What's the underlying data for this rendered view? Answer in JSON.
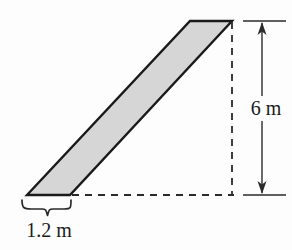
{
  "figure": {
    "background_color": "#fdfdfd",
    "shape": {
      "name": "parallelogram",
      "fill_color": "#d6d6d6",
      "stroke_color": "#1a1a1a",
      "stroke_width": 2.4,
      "vertices": [
        {
          "x": 27,
          "y": 195,
          "label": "bottom-left"
        },
        {
          "x": 70,
          "y": 195,
          "label": "bottom-right"
        },
        {
          "x": 232,
          "y": 21,
          "label": "top-right"
        },
        {
          "x": 190,
          "y": 21,
          "label": "top-left"
        }
      ]
    },
    "construction_lines": [
      {
        "name": "vertical-dashed-line",
        "style": "dashed",
        "color": "#1a1a1a",
        "x1": 232,
        "y1": 21,
        "x2": 232,
        "y2": 195
      },
      {
        "name": "horizontal-dashed-line",
        "style": "dashed",
        "color": "#1a1a1a",
        "x1": 72,
        "y1": 195,
        "x2": 234,
        "y2": 195
      }
    ],
    "dimensions": [
      {
        "name": "height-dimension",
        "value": "6 m",
        "number": 6,
        "unit": "m",
        "orientation": "vertical",
        "arrow_x": 262,
        "y_top": 21,
        "y_bottom": 195,
        "extension_tick_x1": 243,
        "extension_tick_x2": 286,
        "double_headed": true
      },
      {
        "name": "base-dimension",
        "value": "1.2 m",
        "number": 1.2,
        "unit": "m",
        "orientation": "horizontal",
        "marker": "curly-brace",
        "x_left": 22,
        "x_right": 72,
        "y": 201,
        "tip_y": 216
      }
    ]
  },
  "labels": {
    "height": "6 m",
    "base": "1.2 m"
  }
}
